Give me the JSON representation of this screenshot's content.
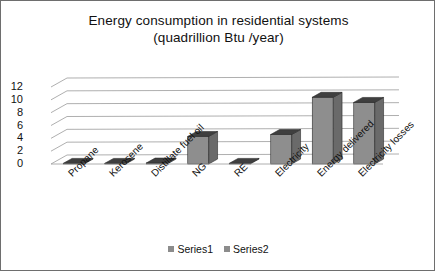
{
  "chart_data": {
    "type": "bar",
    "title": "Energy consumption in residential systems",
    "subtitle": "(quadrillion Btu /year)",
    "xlabel": "",
    "ylabel": "",
    "ylim": [
      0,
      12
    ],
    "yticks": [
      0,
      2,
      4,
      6,
      8,
      10,
      12
    ],
    "grid": true,
    "legend_position": "bottom",
    "style": "3d-bar",
    "categories": [
      "Propane",
      "Kerosene",
      "Distillate fuel oil",
      "NG",
      "RE",
      "Electricity",
      "Energy delivered",
      "Electricity losses"
    ],
    "series": [
      {
        "name": "Series1",
        "color": "#8c8c8c",
        "values": [
          0.1,
          0.1,
          0.15,
          4.3,
          0.1,
          4.6,
          10.4,
          9.6
        ]
      },
      {
        "name": "Series2",
        "color": "#8c8c8c",
        "values": [
          0,
          0,
          0,
          0,
          0,
          0,
          0,
          0
        ]
      }
    ]
  },
  "legend": {
    "entries": [
      {
        "label": "Series1",
        "color": "#8c8c8c"
      },
      {
        "label": "Series2",
        "color": "#8c8c8c"
      }
    ]
  },
  "colors": {
    "bar_front": "#8e8e8e",
    "bar_side": "#6a6a6a",
    "bar_top": "#3f3f3f",
    "gridline": "#9a9a9a",
    "frame_border": "#6e6e6e",
    "background": "#ffffff",
    "text": "#111111"
  }
}
